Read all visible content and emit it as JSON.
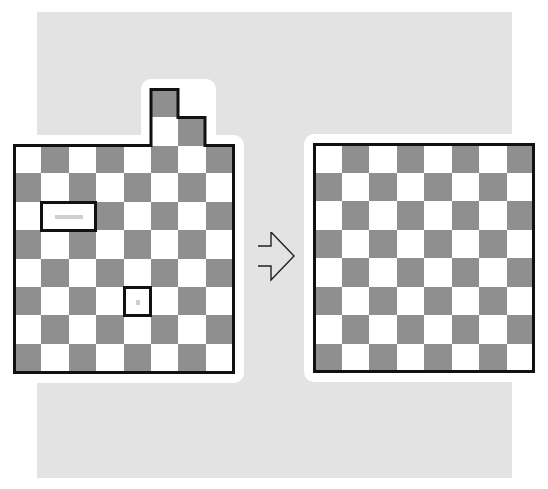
{
  "diagram": {
    "colors": {
      "background_panel": "#e3e3e3",
      "dark_cell": "#8f8f8f",
      "light_cell": "#ffffff",
      "outline": "#111111",
      "marker": "#cfcfcf"
    },
    "left_board": {
      "label": "before",
      "columns": 8,
      "rows": 8,
      "first_cell_color": "white",
      "extra_cells": [
        {
          "row": -2,
          "col": 5,
          "color": "gray"
        },
        {
          "row": -1,
          "col": 5,
          "color": "white"
        },
        {
          "row": -1,
          "col": 6,
          "color": "gray"
        }
      ],
      "marked_regions": [
        {
          "row": 2,
          "col_start": 1,
          "col_end": 2,
          "shape": "domino",
          "marker": "dash"
        },
        {
          "row": 5,
          "col_start": 4,
          "col_end": 4,
          "shape": "single",
          "marker": "dot"
        }
      ]
    },
    "arrow": {
      "direction": "right",
      "style": "outline"
    },
    "right_board": {
      "label": "after",
      "columns": 8,
      "rows": 8,
      "first_cell_color": "white"
    }
  }
}
